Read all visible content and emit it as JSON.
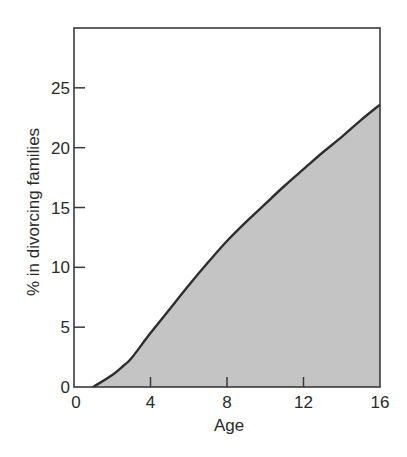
{
  "chart_data": {
    "type": "area",
    "title": "",
    "xlabel": "Age",
    "ylabel": "% in divorcing families",
    "xlim": [
      0,
      16
    ],
    "ylim": [
      0,
      30
    ],
    "x_ticks": [
      0,
      4,
      8,
      12,
      16
    ],
    "y_ticks": [
      0,
      5,
      10,
      15,
      20,
      25
    ],
    "grid": false,
    "legend": null,
    "series": [
      {
        "name": "% in divorcing families",
        "x": [
          1,
          2,
          2.6,
          3,
          4,
          5,
          6,
          7,
          8,
          9,
          10,
          11,
          12,
          13,
          14,
          15,
          16
        ],
        "values": [
          0,
          1.0,
          1.8,
          2.4,
          4.5,
          6.5,
          8.5,
          10.4,
          12.2,
          13.8,
          15.3,
          16.8,
          18.2,
          19.6,
          20.9,
          22.3,
          23.6
        ]
      }
    ],
    "colors": {
      "fill": "#c4c4c4",
      "line": "#2e2e2e",
      "axis": "#3a3a3a"
    }
  }
}
